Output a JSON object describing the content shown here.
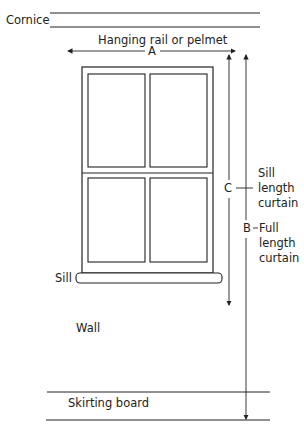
{
  "diagram": {
    "labels": {
      "cornice": "Cornice",
      "hanging_rail": "Hanging rail or pelmet",
      "dim_a": "A",
      "dim_b": "B",
      "dim_c": "C",
      "sill_length_1": "Sill",
      "sill_length_2": "length",
      "sill_length_3": "curtain",
      "full_length_1": "Full",
      "full_length_2": "length",
      "full_length_3": "curtain",
      "sill": "Sill",
      "wall": "Wall",
      "skirting_board": "Skirting board"
    },
    "colors": {
      "line": "#222222",
      "background": "#ffffff"
    }
  }
}
